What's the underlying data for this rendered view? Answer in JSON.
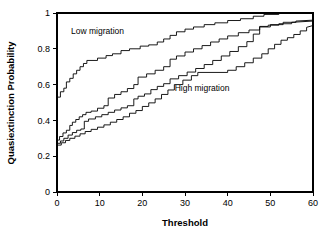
{
  "chart_data": {
    "type": "line",
    "title": "",
    "xlabel": "Threshold",
    "ylabel": "Quasiextinction Probability",
    "xlim": [
      0,
      60
    ],
    "ylim": [
      0,
      1
    ],
    "xticks": [
      0,
      10,
      20,
      30,
      40,
      50,
      60
    ],
    "yticks": [
      0,
      0.2,
      0.4,
      0.6,
      0.8,
      1
    ],
    "xtick_labels": [
      "0",
      "10",
      "20",
      "30",
      "40",
      "50",
      "60"
    ],
    "ytick_labels": [
      "0",
      "0.2",
      "0.4",
      "0.6",
      "0.8",
      "1"
    ],
    "grid": false,
    "legend": "none",
    "annotations": [
      {
        "text": "Low migration",
        "x": 9.5,
        "y": 0.885
      },
      {
        "text": "High migration",
        "x": 34.0,
        "y": 0.565
      }
    ],
    "series": [
      {
        "name": "Low migration (upper)",
        "points": [
          [
            0,
            0.53
          ],
          [
            0.8,
            0.53
          ],
          [
            0.8,
            0.56
          ],
          [
            1.6,
            0.56
          ],
          [
            1.6,
            0.58
          ],
          [
            2.2,
            0.58
          ],
          [
            2.2,
            0.615
          ],
          [
            3.0,
            0.615
          ],
          [
            3.0,
            0.635
          ],
          [
            3.8,
            0.635
          ],
          [
            3.8,
            0.66
          ],
          [
            4.6,
            0.66
          ],
          [
            4.6,
            0.68
          ],
          [
            5.4,
            0.68
          ],
          [
            5.4,
            0.7
          ],
          [
            6.2,
            0.7
          ],
          [
            6.2,
            0.718
          ],
          [
            7.0,
            0.718
          ],
          [
            7.0,
            0.735
          ],
          [
            9.5,
            0.735
          ],
          [
            9.5,
            0.748
          ],
          [
            11.5,
            0.748
          ],
          [
            11.5,
            0.762
          ],
          [
            13.0,
            0.762
          ],
          [
            13.0,
            0.772
          ],
          [
            15.0,
            0.772
          ],
          [
            15.0,
            0.79
          ],
          [
            17.0,
            0.79
          ],
          [
            17.0,
            0.8
          ],
          [
            19.5,
            0.8
          ],
          [
            19.5,
            0.815
          ],
          [
            21.5,
            0.815
          ],
          [
            21.5,
            0.822
          ],
          [
            23.5,
            0.822
          ],
          [
            23.5,
            0.838
          ],
          [
            25.0,
            0.838
          ],
          [
            25.0,
            0.855
          ],
          [
            26.5,
            0.855
          ],
          [
            26.5,
            0.875
          ],
          [
            28.0,
            0.875
          ],
          [
            28.0,
            0.895
          ],
          [
            30.0,
            0.895
          ],
          [
            30.0,
            0.91
          ],
          [
            32.0,
            0.91
          ],
          [
            32.0,
            0.922
          ],
          [
            34.5,
            0.922
          ],
          [
            34.5,
            0.935
          ],
          [
            37.0,
            0.935
          ],
          [
            37.0,
            0.945
          ],
          [
            40.0,
            0.945
          ],
          [
            40.0,
            0.958
          ],
          [
            43.0,
            0.958
          ],
          [
            43.0,
            0.968
          ],
          [
            46.0,
            0.968
          ],
          [
            46.0,
            0.982
          ],
          [
            48.5,
            0.982
          ],
          [
            48.5,
            0.992
          ],
          [
            52.0,
            0.992
          ],
          [
            52.0,
            1.0
          ],
          [
            60,
            1.0
          ]
        ]
      },
      {
        "name": "Low migration (lower)",
        "points": [
          [
            0,
            0.29
          ],
          [
            0.6,
            0.29
          ],
          [
            0.6,
            0.31
          ],
          [
            1.4,
            0.31
          ],
          [
            1.4,
            0.33
          ],
          [
            2.2,
            0.33
          ],
          [
            2.2,
            0.345
          ],
          [
            3.0,
            0.345
          ],
          [
            3.0,
            0.372
          ],
          [
            3.6,
            0.372
          ],
          [
            3.6,
            0.39
          ],
          [
            4.4,
            0.39
          ],
          [
            4.4,
            0.405
          ],
          [
            5.2,
            0.405
          ],
          [
            5.2,
            0.42
          ],
          [
            6.0,
            0.42
          ],
          [
            6.0,
            0.432
          ],
          [
            6.8,
            0.432
          ],
          [
            6.8,
            0.445
          ],
          [
            8.0,
            0.445
          ],
          [
            8.0,
            0.452
          ],
          [
            9.5,
            0.452
          ],
          [
            9.5,
            0.468
          ],
          [
            11.0,
            0.468
          ],
          [
            11.0,
            0.482
          ],
          [
            12.0,
            0.482
          ],
          [
            12.0,
            0.525
          ],
          [
            13.5,
            0.525
          ],
          [
            13.5,
            0.545
          ],
          [
            15.0,
            0.545
          ],
          [
            15.0,
            0.56
          ],
          [
            16.5,
            0.56
          ],
          [
            16.5,
            0.578
          ],
          [
            18.0,
            0.578
          ],
          [
            18.0,
            0.6
          ],
          [
            19.0,
            0.6
          ],
          [
            19.0,
            0.642
          ],
          [
            21.0,
            0.642
          ],
          [
            21.0,
            0.66
          ],
          [
            23.0,
            0.66
          ],
          [
            23.0,
            0.68
          ],
          [
            25.0,
            0.68
          ],
          [
            25.0,
            0.7
          ],
          [
            26.5,
            0.7
          ],
          [
            26.5,
            0.742
          ],
          [
            28.0,
            0.742
          ],
          [
            28.0,
            0.76
          ],
          [
            30.0,
            0.76
          ],
          [
            30.0,
            0.782
          ],
          [
            32.0,
            0.782
          ],
          [
            32.0,
            0.8
          ],
          [
            34.0,
            0.8
          ],
          [
            34.0,
            0.818
          ],
          [
            36.0,
            0.818
          ],
          [
            36.0,
            0.838
          ],
          [
            38.0,
            0.838
          ],
          [
            38.0,
            0.855
          ],
          [
            40.0,
            0.855
          ],
          [
            40.0,
            0.872
          ],
          [
            42.5,
            0.872
          ],
          [
            42.5,
            0.89
          ],
          [
            45.0,
            0.89
          ],
          [
            45.0,
            0.905
          ],
          [
            47.5,
            0.905
          ],
          [
            47.5,
            0.922
          ],
          [
            50.0,
            0.922
          ],
          [
            50.0,
            0.935
          ],
          [
            53.0,
            0.935
          ],
          [
            53.0,
            0.948
          ],
          [
            56.0,
            0.948
          ],
          [
            56.0,
            0.955
          ],
          [
            60,
            0.96
          ]
        ]
      },
      {
        "name": "High migration (upper)",
        "points": [
          [
            0,
            0.272
          ],
          [
            0.8,
            0.272
          ],
          [
            0.8,
            0.285
          ],
          [
            1.6,
            0.285
          ],
          [
            1.6,
            0.3
          ],
          [
            2.6,
            0.3
          ],
          [
            2.6,
            0.318
          ],
          [
            3.6,
            0.318
          ],
          [
            3.6,
            0.332
          ],
          [
            4.6,
            0.332
          ],
          [
            4.6,
            0.345
          ],
          [
            5.6,
            0.345
          ],
          [
            5.6,
            0.352
          ],
          [
            6.4,
            0.352
          ],
          [
            6.4,
            0.395
          ],
          [
            7.4,
            0.395
          ],
          [
            7.4,
            0.408
          ],
          [
            9.0,
            0.408
          ],
          [
            9.0,
            0.42
          ],
          [
            10.5,
            0.42
          ],
          [
            10.5,
            0.432
          ],
          [
            12.0,
            0.432
          ],
          [
            12.0,
            0.445
          ],
          [
            13.5,
            0.445
          ],
          [
            13.5,
            0.458
          ],
          [
            15.0,
            0.458
          ],
          [
            15.0,
            0.47
          ],
          [
            16.5,
            0.47
          ],
          [
            16.5,
            0.482
          ],
          [
            18.0,
            0.482
          ],
          [
            18.0,
            0.52
          ],
          [
            19.0,
            0.52
          ],
          [
            19.0,
            0.535
          ],
          [
            20.5,
            0.535
          ],
          [
            20.5,
            0.548
          ],
          [
            22.0,
            0.548
          ],
          [
            22.0,
            0.572
          ],
          [
            23.5,
            0.572
          ],
          [
            23.5,
            0.59
          ],
          [
            25.0,
            0.59
          ],
          [
            25.0,
            0.605
          ],
          [
            26.5,
            0.605
          ],
          [
            26.5,
            0.632
          ],
          [
            28.5,
            0.632
          ],
          [
            28.5,
            0.65
          ],
          [
            30.5,
            0.65
          ],
          [
            30.5,
            0.67
          ],
          [
            32.5,
            0.67
          ],
          [
            32.5,
            0.69
          ],
          [
            34.5,
            0.69
          ],
          [
            34.5,
            0.712
          ],
          [
            36.5,
            0.712
          ],
          [
            36.5,
            0.735
          ],
          [
            38.5,
            0.735
          ],
          [
            38.5,
            0.76
          ],
          [
            40.5,
            0.76
          ],
          [
            40.5,
            0.785
          ],
          [
            42.5,
            0.785
          ],
          [
            42.5,
            0.812
          ],
          [
            44.5,
            0.812
          ],
          [
            44.5,
            0.84
          ],
          [
            46.0,
            0.84
          ],
          [
            46.0,
            0.882
          ],
          [
            47.5,
            0.882
          ],
          [
            47.5,
            0.925
          ],
          [
            49.5,
            0.925
          ],
          [
            49.5,
            0.932
          ],
          [
            52.0,
            0.932
          ],
          [
            52.0,
            0.94
          ],
          [
            55.0,
            0.94
          ],
          [
            55.0,
            0.948
          ],
          [
            60,
            0.955
          ]
        ]
      },
      {
        "name": "High migration (lower)",
        "points": [
          [
            0,
            0.262
          ],
          [
            1.0,
            0.262
          ],
          [
            1.0,
            0.275
          ],
          [
            2.0,
            0.275
          ],
          [
            2.0,
            0.288
          ],
          [
            3.0,
            0.288
          ],
          [
            3.0,
            0.3
          ],
          [
            4.2,
            0.3
          ],
          [
            4.2,
            0.312
          ],
          [
            5.4,
            0.312
          ],
          [
            5.4,
            0.325
          ],
          [
            6.6,
            0.325
          ],
          [
            6.6,
            0.338
          ],
          [
            8.0,
            0.338
          ],
          [
            8.0,
            0.35
          ],
          [
            9.5,
            0.35
          ],
          [
            9.5,
            0.362
          ],
          [
            11.0,
            0.362
          ],
          [
            11.0,
            0.375
          ],
          [
            12.5,
            0.375
          ],
          [
            12.5,
            0.39
          ],
          [
            14.0,
            0.39
          ],
          [
            14.0,
            0.405
          ],
          [
            15.5,
            0.405
          ],
          [
            15.5,
            0.42
          ],
          [
            17.0,
            0.42
          ],
          [
            17.0,
            0.44
          ],
          [
            18.5,
            0.44
          ],
          [
            18.5,
            0.455
          ],
          [
            20.0,
            0.455
          ],
          [
            20.0,
            0.478
          ],
          [
            21.5,
            0.478
          ],
          [
            21.5,
            0.498
          ],
          [
            23.0,
            0.498
          ],
          [
            23.0,
            0.52
          ],
          [
            24.5,
            0.52
          ],
          [
            24.5,
            0.545
          ],
          [
            26.0,
            0.545
          ],
          [
            26.0,
            0.57
          ],
          [
            27.5,
            0.57
          ],
          [
            27.5,
            0.6
          ],
          [
            29.5,
            0.6
          ],
          [
            29.5,
            0.625
          ],
          [
            31.5,
            0.625
          ],
          [
            31.5,
            0.65
          ],
          [
            33.0,
            0.65
          ],
          [
            33.0,
            0.668
          ],
          [
            40.0,
            0.668
          ],
          [
            40.0,
            0.68
          ],
          [
            42.0,
            0.68
          ],
          [
            42.0,
            0.7
          ],
          [
            44.0,
            0.7
          ],
          [
            44.0,
            0.722
          ],
          [
            46.0,
            0.722
          ],
          [
            46.0,
            0.748
          ],
          [
            48.0,
            0.748
          ],
          [
            48.0,
            0.772
          ],
          [
            49.5,
            0.772
          ],
          [
            49.5,
            0.8
          ],
          [
            51.0,
            0.8
          ],
          [
            51.0,
            0.825
          ],
          [
            52.5,
            0.825
          ],
          [
            52.5,
            0.848
          ],
          [
            54.0,
            0.848
          ],
          [
            54.0,
            0.862
          ],
          [
            55.5,
            0.862
          ],
          [
            55.5,
            0.88
          ],
          [
            57.0,
            0.88
          ],
          [
            57.0,
            0.9
          ],
          [
            58.5,
            0.9
          ],
          [
            58.5,
            0.92
          ],
          [
            60,
            0.93
          ]
        ]
      }
    ]
  }
}
